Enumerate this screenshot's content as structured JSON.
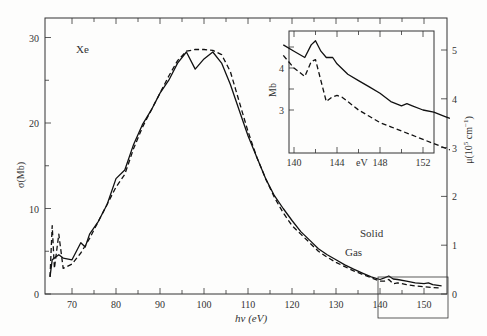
{
  "chart_data": {
    "type": "line",
    "title": "",
    "element_label": "Xe",
    "xlabel": "hν (eV)",
    "ylabel_left": "σ(Mb)",
    "ylabel_right": "μ(10⁵ cm⁻¹)",
    "xlim": [
      65,
      154
    ],
    "ylim_left": [
      0,
      31
    ],
    "ylim_right": [
      0,
      5.6
    ],
    "x_ticks": [
      70,
      80,
      90,
      100,
      110,
      120,
      130,
      140,
      150
    ],
    "y_ticks_left": [
      0,
      10,
      20
    ],
    "y_ticks_right": [
      0,
      1,
      2,
      3,
      4,
      5
    ],
    "grid": false,
    "legend": "inline labels",
    "series": [
      {
        "name": "Solid",
        "style": "solid",
        "x": [
          65,
          65.5,
          66,
          67,
          68,
          70,
          72,
          73,
          74,
          76,
          78,
          80,
          82,
          84,
          86,
          88,
          90,
          92,
          94,
          96,
          98,
          100,
          102,
          104,
          106,
          108,
          110,
          112,
          114,
          116,
          118,
          120,
          122,
          124,
          126,
          128,
          130,
          132,
          134,
          136,
          138,
          140,
          141,
          142,
          143,
          144,
          146,
          148,
          150,
          151,
          152,
          154
        ],
        "y": [
          2.0,
          4.0,
          4.2,
          4.6,
          4.2,
          4.0,
          6.0,
          5.5,
          7.0,
          8.5,
          10.5,
          13.5,
          14.5,
          17.5,
          19.8,
          21.5,
          23.5,
          25.0,
          27.0,
          28.3,
          26.3,
          27.5,
          28.3,
          27.0,
          24.5,
          21.5,
          18.5,
          16.0,
          13.5,
          11.5,
          10.0,
          8.6,
          7.3,
          6.3,
          5.3,
          4.6,
          4.0,
          3.4,
          2.9,
          2.45,
          2.0,
          1.7,
          1.9,
          2.1,
          1.75,
          1.7,
          1.5,
          1.3,
          1.2,
          1.3,
          1.1,
          0.95
        ]
      },
      {
        "name": "Gas",
        "style": "dashed",
        "x": [
          65,
          65.5,
          66,
          67,
          68,
          70,
          72,
          74,
          76,
          78,
          80,
          82,
          84,
          86,
          88,
          90,
          92,
          94,
          96,
          98,
          100,
          102,
          104,
          106,
          108,
          110,
          112,
          114,
          116,
          118,
          120,
          122,
          124,
          126,
          128,
          130,
          132,
          134,
          136,
          138,
          140,
          141,
          142,
          143,
          144,
          146,
          148,
          150,
          152,
          154
        ],
        "y": [
          2.0,
          8.0,
          3.0,
          7.0,
          3.0,
          3.5,
          4.8,
          6.5,
          8.5,
          10.5,
          12.5,
          14.0,
          17.0,
          19.5,
          21.5,
          23.5,
          25.5,
          27.3,
          28.4,
          28.6,
          28.6,
          28.5,
          28.0,
          26.0,
          22.5,
          19.0,
          16.0,
          13.5,
          11.3,
          9.5,
          8.0,
          7.0,
          6.0,
          5.0,
          4.3,
          3.7,
          3.2,
          2.7,
          2.3,
          1.9,
          1.5,
          1.5,
          1.7,
          1.2,
          1.3,
          1.1,
          0.95,
          0.85,
          0.75,
          0.7
        ]
      }
    ],
    "annotations": [
      "Solid",
      "Gas"
    ],
    "inset": {
      "xlabel": "eV",
      "ylabel": "Mb",
      "xlim": [
        139,
        154.5
      ],
      "ylim": [
        2.65,
        5.25
      ],
      "x_ticks": [
        140,
        144,
        148,
        152
      ],
      "y_ticks": [
        3,
        4
      ],
      "series": [
        {
          "name": "Solid",
          "style": "solid",
          "x": [
            139,
            140,
            141,
            141.6,
            142,
            142.5,
            143,
            143.6,
            144,
            145,
            146,
            147,
            148,
            149,
            150,
            150.5,
            151,
            152,
            153,
            154,
            154.5
          ],
          "y": [
            4.55,
            4.4,
            4.25,
            4.55,
            4.65,
            4.4,
            4.25,
            4.25,
            4.1,
            3.85,
            3.7,
            3.55,
            3.4,
            3.2,
            3.1,
            3.15,
            3.1,
            3.0,
            2.95,
            2.85,
            2.8
          ]
        },
        {
          "name": "Gas",
          "style": "dashed",
          "x": [
            139,
            140,
            141,
            141.6,
            142,
            142.5,
            143,
            143.5,
            144,
            144.5,
            145,
            146,
            147,
            148,
            149,
            150,
            151,
            152,
            153,
            154,
            154.5
          ],
          "y": [
            4.3,
            4.0,
            3.8,
            4.15,
            4.2,
            3.7,
            3.2,
            3.3,
            3.35,
            3.3,
            3.2,
            3.0,
            2.85,
            2.7,
            2.6,
            2.5,
            2.4,
            2.3,
            2.2,
            2.1,
            2.05
          ]
        }
      ]
    }
  },
  "labels": {
    "element": "Xe",
    "solid": "Solid",
    "gas": "Gas",
    "xlabel": "hν (eV)",
    "ylabel_left": "σ(Mb)",
    "ylabel_right_main": "μ(10",
    "ylabel_right_sup": "5",
    "ylabel_right_unit": " cm",
    "ylabel_right_sup2": "−1",
    "ylabel_right_end": ")",
    "inset_xlabel": "eV",
    "inset_ylabel": "Mb"
  }
}
